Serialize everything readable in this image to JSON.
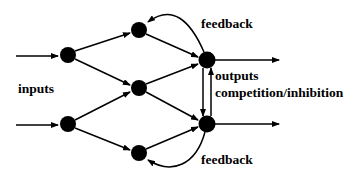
{
  "diagram": {
    "title": "",
    "labels": {
      "inputs": "inputs",
      "feedback_top": "feedback",
      "outputs": "outputs",
      "competition": "competition/inhibition",
      "feedback_bottom": "feedback"
    },
    "colors": {
      "node": "#000000",
      "edge": "#000000",
      "background": "#ffffff"
    },
    "nodes": [
      {
        "id": "input-top",
        "layer": "input",
        "x": 68,
        "y": 55
      },
      {
        "id": "input-bottom",
        "layer": "input",
        "x": 68,
        "y": 124
      },
      {
        "id": "hidden-top",
        "layer": "hidden",
        "x": 139,
        "y": 30
      },
      {
        "id": "hidden-middle",
        "layer": "hidden",
        "x": 139,
        "y": 88
      },
      {
        "id": "hidden-bottom",
        "layer": "hidden",
        "x": 139,
        "y": 153
      },
      {
        "id": "output-top",
        "layer": "output",
        "x": 207,
        "y": 60
      },
      {
        "id": "output-bottom",
        "layer": "output",
        "x": 207,
        "y": 124
      }
    ],
    "edges": [
      {
        "from": "external",
        "to": "input-top",
        "type": "input"
      },
      {
        "from": "external",
        "to": "input-bottom",
        "type": "input"
      },
      {
        "from": "input-top",
        "to": "hidden-top",
        "type": "forward"
      },
      {
        "from": "input-top",
        "to": "hidden-middle",
        "type": "forward"
      },
      {
        "from": "input-bottom",
        "to": "hidden-middle",
        "type": "forward"
      },
      {
        "from": "input-bottom",
        "to": "hidden-bottom",
        "type": "forward"
      },
      {
        "from": "hidden-top",
        "to": "output-top",
        "type": "forward"
      },
      {
        "from": "hidden-middle",
        "to": "output-top",
        "type": "forward"
      },
      {
        "from": "hidden-middle",
        "to": "output-bottom",
        "type": "forward"
      },
      {
        "from": "hidden-bottom",
        "to": "output-bottom",
        "type": "forward"
      },
      {
        "from": "output-top",
        "to": "hidden-top",
        "type": "feedback"
      },
      {
        "from": "output-bottom",
        "to": "hidden-bottom",
        "type": "feedback"
      },
      {
        "from": "output-top",
        "to": "output-bottom",
        "type": "competition"
      },
      {
        "from": "output-bottom",
        "to": "output-top",
        "type": "competition"
      },
      {
        "from": "output-top",
        "to": "external",
        "type": "output"
      },
      {
        "from": "output-bottom",
        "to": "external",
        "type": "output"
      }
    ]
  }
}
